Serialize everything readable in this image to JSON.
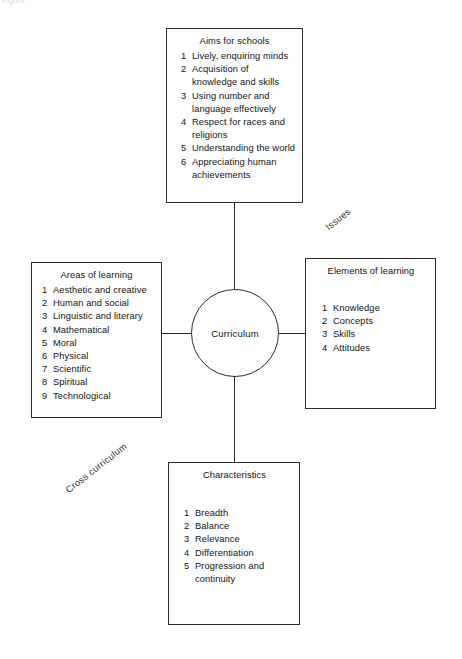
{
  "figure": {
    "caption_fragment": "Figure",
    "center": {
      "label": "Curriculum"
    },
    "diagonal_labels": {
      "issues": "Issues",
      "cross_curriculum": "Cross curriculum"
    },
    "boxes": {
      "aims": {
        "title": "Aims for schools",
        "items": [
          {
            "num": "1",
            "text": "Lively, enquiring minds"
          },
          {
            "num": "2",
            "text": "Acquisition of knowledge and skills"
          },
          {
            "num": "3",
            "text": "Using number and language effectively"
          },
          {
            "num": "4",
            "text": "Respect for races and religions"
          },
          {
            "num": "5",
            "text": "Understanding the world"
          },
          {
            "num": "6",
            "text": "Appreciating human achievements"
          }
        ]
      },
      "areas": {
        "title": "Areas of learning",
        "items": [
          {
            "num": "1",
            "text": "Aesthetic and creative"
          },
          {
            "num": "2",
            "text": "Human and social"
          },
          {
            "num": "3",
            "text": "Linguistic and literary"
          },
          {
            "num": "4",
            "text": "Mathematical"
          },
          {
            "num": "5",
            "text": "Moral"
          },
          {
            "num": "6",
            "text": "Physical"
          },
          {
            "num": "7",
            "text": "Scientific"
          },
          {
            "num": "8",
            "text": "Spiritual"
          },
          {
            "num": "9",
            "text": "Technological"
          }
        ]
      },
      "elements": {
        "title": "Elements of learning",
        "items": [
          {
            "num": "1",
            "text": "Knowledge"
          },
          {
            "num": "2",
            "text": "Concepts"
          },
          {
            "num": "3",
            "text": "Skills"
          },
          {
            "num": "4",
            "text": "Attitudes"
          }
        ]
      },
      "characteristics": {
        "title": "Characteristics",
        "items": [
          {
            "num": "1",
            "text": "Breadth"
          },
          {
            "num": "2",
            "text": "Balance"
          },
          {
            "num": "3",
            "text": "Relevance"
          },
          {
            "num": "4",
            "text": "Differentiation"
          },
          {
            "num": "5",
            "text": "Progression and continuity"
          }
        ]
      }
    },
    "colors": {
      "line": "#2a2a2a",
      "text": "#111111",
      "background": "#ffffff"
    }
  }
}
